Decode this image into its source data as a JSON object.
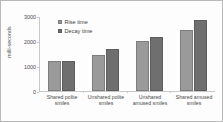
{
  "chart_data": {
    "type": "bar",
    "title": "",
    "xlabel": "",
    "ylabel": "milli-seconds",
    "ylim": [
      0,
      3000
    ],
    "yticks": [
      0,
      1000,
      2000,
      3000
    ],
    "grid": false,
    "legend_position": "upper-left-inside",
    "categories": [
      "Shared polite smiles",
      "Unshared polite smiles",
      "Unshared amused smiles",
      "Shared amused smiles"
    ],
    "series": [
      {
        "name": "Rise time",
        "color": "#9a9a9a",
        "values": [
          1200,
          1420,
          1990,
          2440
        ]
      },
      {
        "name": "Decay time",
        "color": "#6f6f6f",
        "values": [
          1180,
          1670,
          2160,
          2830
        ]
      }
    ]
  },
  "axis": {
    "y_tick_labels": [
      "0",
      "1000",
      "2000",
      "3000"
    ],
    "y_title": "milli-seconds"
  },
  "legend": {
    "entries": [
      {
        "label": "Rise time"
      },
      {
        "label": "Decay time"
      }
    ]
  },
  "x_tick_labels": [
    "Shared polite smiles",
    "Unshared polite smiles",
    "Unshared amused smiles",
    "Shared amused smiles"
  ]
}
